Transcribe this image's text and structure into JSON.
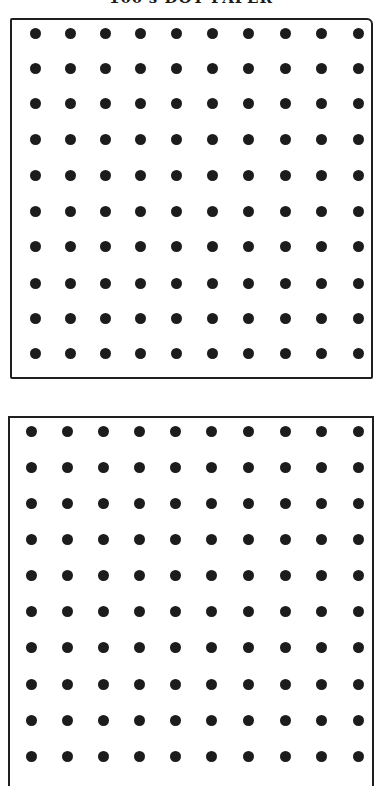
{
  "page": {
    "title": "100's DOT PAPER"
  },
  "grids": [
    {
      "name": "top-dot-grid",
      "rows": 10,
      "cols": 10,
      "dot_centers_x": [
        35,
        70,
        105,
        140,
        176,
        212,
        248,
        285,
        321,
        358
      ],
      "dot_centers_y": [
        33,
        68,
        103,
        139,
        175,
        211,
        246,
        283,
        318,
        353
      ]
    },
    {
      "name": "bottom-dot-grid",
      "rows": 10,
      "cols": 10,
      "dot_centers_x": [
        31,
        67,
        103,
        139,
        175,
        211,
        248,
        285,
        321,
        358
      ],
      "dot_centers_y": [
        431,
        467,
        503,
        539,
        575,
        611,
        647,
        684,
        720,
        756
      ]
    }
  ],
  "colors": {
    "ink": "#1c1c1c",
    "paper": "#ffffff"
  }
}
